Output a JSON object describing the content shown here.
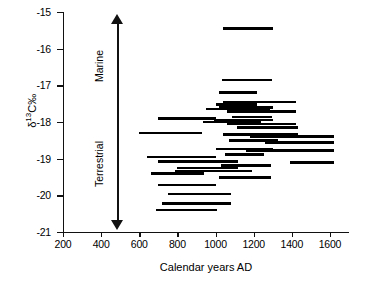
{
  "chart_data": {
    "type": "bar",
    "title": "",
    "xlabel": "Calendar years AD",
    "ylabel": "δ13C‰",
    "ylabel_parts": {
      "delta": "δ",
      "sup": "13",
      "rest": "C‰"
    },
    "xlim": [
      200,
      1700
    ],
    "ylim": [
      -21,
      -15
    ],
    "xticks": [
      200,
      400,
      600,
      800,
      1000,
      1200,
      1400,
      1600
    ],
    "yticks": [
      -15,
      -16,
      -17,
      -18,
      -19,
      -20,
      -21
    ],
    "grid": false,
    "legend": null,
    "orientation": "horizontal-range-bars",
    "annotations": [
      {
        "name": "marine-direction-label",
        "text": "Marine",
        "direction": "up"
      },
      {
        "name": "terrestrial-direction-label",
        "text": "Terrestrial",
        "direction": "down"
      },
      {
        "name": "direction-arrow",
        "text": "",
        "direction": "double"
      }
    ],
    "bar_color": "#000000",
    "series": [
      {
        "name": "samples",
        "fields": [
          "x_start",
          "x_end",
          "y"
        ],
        "values": [
          [
            1040,
            1300,
            -15.45
          ],
          [
            1035,
            1295,
            -16.85
          ],
          [
            1020,
            1215,
            -17.2
          ],
          [
            1040,
            1420,
            -17.45
          ],
          [
            1000,
            1215,
            -17.52
          ],
          [
            1020,
            1300,
            -17.6
          ],
          [
            950,
            1285,
            -17.65
          ],
          [
            1060,
            1420,
            -17.72
          ],
          [
            1085,
            1295,
            -17.86
          ],
          [
            700,
            1000,
            -17.9
          ],
          [
            990,
            1300,
            -17.95
          ],
          [
            935,
            1240,
            -18.0
          ],
          [
            1060,
            1420,
            -18.06
          ],
          [
            1110,
            1430,
            -18.15
          ],
          [
            600,
            930,
            -18.3
          ],
          [
            1040,
            1430,
            -18.34
          ],
          [
            1180,
            1620,
            -18.4
          ],
          [
            1070,
            1330,
            -18.5
          ],
          [
            1260,
            1620,
            -18.56
          ],
          [
            1000,
            1300,
            -18.74
          ],
          [
            1160,
            1620,
            -18.78
          ],
          [
            1050,
            1255,
            -18.88
          ],
          [
            640,
            1000,
            -18.96
          ],
          [
            700,
            1120,
            -19.08
          ],
          [
            1390,
            1620,
            -19.1
          ],
          [
            1030,
            1290,
            -19.18
          ],
          [
            800,
            1120,
            -19.26
          ],
          [
            790,
            1190,
            -19.34
          ],
          [
            660,
            940,
            -19.4
          ],
          [
            1020,
            1290,
            -19.52
          ],
          [
            700,
            1000,
            -19.72
          ],
          [
            750,
            1080,
            -19.96
          ],
          [
            720,
            1080,
            -20.22
          ],
          [
            690,
            1010,
            -20.4
          ]
        ]
      }
    ]
  },
  "axis": {
    "y_title_delta": "δ",
    "y_title_sup": "13",
    "y_title_rest": "C‰",
    "x_title": "Calendar years AD"
  },
  "annotation": {
    "marine": "Marine",
    "terrestrial": "Terrestrial"
  }
}
